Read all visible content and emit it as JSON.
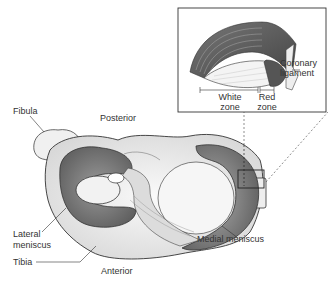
{
  "labels": {
    "fibula": "Fibula",
    "posterior": "Posterior",
    "lateral_meniscus_1": "Lateral",
    "lateral_meniscus_2": "meniscus",
    "tibia": "Tibia",
    "anterior": "Anterior",
    "medial_meniscus": "Medial meniscus",
    "coronary_ligament_1": "Coronary",
    "coronary_ligament_2": "ligament",
    "white_zone_1": "White",
    "white_zone_2": "zone",
    "red_zone_1": "Red",
    "red_zone_2": "zone"
  },
  "colors": {
    "meniscus_dark": "#6b6b6b",
    "meniscus_mid": "#8e8e8e",
    "bone": "#f4f4f4",
    "outline": "#333333",
    "inset_red_zone": "#555555"
  }
}
